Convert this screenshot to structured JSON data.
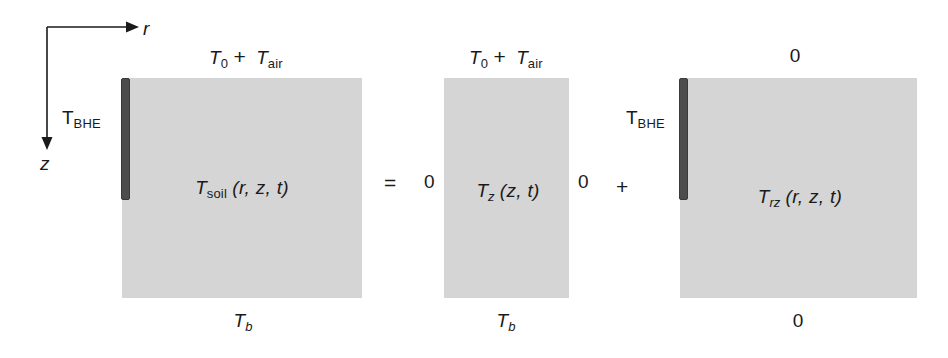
{
  "figure": {
    "width": 948,
    "height": 358,
    "background_color": "#ffffff",
    "block_fill_color": "#d5d5d5",
    "bhe_bar_color": "#4d4d4d",
    "text_color": "#1a1a1a"
  },
  "axes": {
    "horizontal_label": "r",
    "vertical_label": "z"
  },
  "equation": {
    "equals_symbol": "=",
    "plus_symbol": "+"
  },
  "terms": [
    {
      "id": "soil",
      "center_symbol": "T",
      "center_subscript": "soil",
      "center_args": "(r, z, t)",
      "top_boundary": {
        "symbol_1": "T",
        "subscript_1": "0",
        "operator": "+",
        "symbol_2": "T",
        "subscript_2": "air"
      },
      "bottom_boundary": {
        "symbol": "T",
        "subscript": "b"
      },
      "left_boundary_label": {
        "symbol": "T",
        "subscript": "BHE"
      },
      "has_bhe_bar": true,
      "left_zero": null,
      "right_zero": null
    },
    {
      "id": "z",
      "center_symbol": "T",
      "center_subscript": "z",
      "center_args": "(z, t)",
      "top_boundary": {
        "symbol_1": "T",
        "subscript_1": "0",
        "operator": "+",
        "symbol_2": "T",
        "subscript_2": "air"
      },
      "bottom_boundary": {
        "symbol": "T",
        "subscript": "b"
      },
      "left_boundary_label": null,
      "has_bhe_bar": false,
      "left_zero": "0",
      "right_zero": "0"
    },
    {
      "id": "rz",
      "center_symbol": "T",
      "center_subscript": "rz",
      "center_args": "(r, z, t)",
      "top_boundary_zero": "0",
      "bottom_boundary_zero": "0",
      "left_boundary_label": {
        "symbol": "T",
        "subscript": "BHE"
      },
      "has_bhe_bar": true
    }
  ]
}
